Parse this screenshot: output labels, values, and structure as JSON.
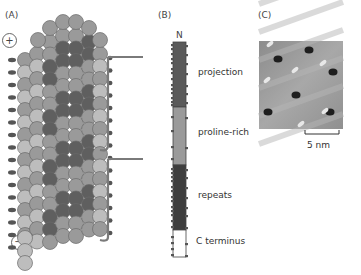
{
  "figure": {
    "panels": [
      {
        "id": "A",
        "label": "(A)",
        "plus_sign": "+",
        "minus_sign": "−",
        "description": "Microtubule lattice of tubulin subunits with bound protein brackets"
      },
      {
        "id": "B",
        "label": "(B)",
        "terminus_top": "N",
        "segments": [
          {
            "name": "projection",
            "label": "projection",
            "color": "#5a5a5a"
          },
          {
            "name": "proline-rich",
            "label": "proline-rich",
            "color": "#9a9a9a"
          },
          {
            "name": "repeats",
            "label": "repeats",
            "color": "#3e3e3e"
          },
          {
            "name": "c-terminus",
            "label": "C terminus",
            "color": "#ffffff"
          }
        ]
      },
      {
        "id": "C",
        "label": "(C)",
        "scale_bar_label": "5 nm",
        "description": "Surface topography image"
      }
    ]
  },
  "colors": {
    "light_subunit": "#bdbdbd",
    "mid_subunit": "#9a9a9a",
    "dark_subunit": "#5f5f5f",
    "bracket": "#7a7a7a"
  }
}
